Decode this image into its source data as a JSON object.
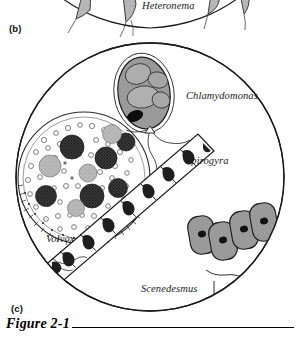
{
  "figure": {
    "caption": "Figure 2-1",
    "panels": [
      {
        "letter": "(b)",
        "name": "panel-b",
        "description": "partial circular field of view, cropped at top of page"
      },
      {
        "letter": "(c)",
        "name": "panel-c",
        "description": "circular microscope field of view with four algae"
      }
    ]
  },
  "panel_b": {
    "letter": "(b)",
    "labels": [
      {
        "name": "heteronema",
        "text": "Heteronema"
      }
    ]
  },
  "panel_c": {
    "letter": "(c)",
    "labels": [
      {
        "name": "chlamydomonas",
        "text": "Chlamydomonas"
      },
      {
        "name": "spirogyra",
        "text": "Spirogyra"
      },
      {
        "name": "volvox",
        "text": "Volvox"
      },
      {
        "name": "scenedesmus",
        "text": "Scenedesmus"
      }
    ]
  },
  "colors": {
    "ink": "#000000",
    "paper": "#ffffff",
    "cell_fill": "#9a9a9a",
    "cell_fill_light": "#c3c3c3",
    "dark_colony": "#2b2b2b",
    "mid_colony": "#b5b5b5"
  }
}
